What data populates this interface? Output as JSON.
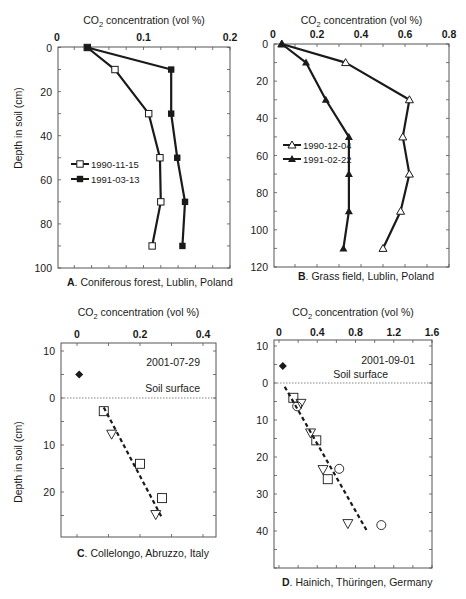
{
  "chart_data": [
    {
      "panel": "A",
      "type": "line",
      "caption_letter": "A",
      "caption": ". Coniferous forest, Lublin, Poland",
      "xlabel": "CO2 concentration (vol %)",
      "ylabel": "Depth in soil (cm)",
      "xlim": [
        0,
        0.2
      ],
      "ylim": [
        0,
        100
      ],
      "xticks": [
        "0",
        "0.1",
        "0.2"
      ],
      "xtick_values": [
        0,
        0.1,
        0.2
      ],
      "xminor_step": 0.02,
      "yticks": [
        "0",
        "20",
        "40",
        "60",
        "80",
        "100"
      ],
      "ytick_values": [
        0,
        20,
        40,
        60,
        80,
        100
      ],
      "yminor_step": 10,
      "legend_position": "middle-left",
      "series": [
        {
          "name": "1990-11-15",
          "marker": "square-open",
          "x": [
            0.035,
            0.067,
            0.106,
            0.119,
            0.12,
            0.11
          ],
          "y": [
            0,
            10,
            30,
            50,
            70,
            90
          ]
        },
        {
          "name": "1991-03-13",
          "marker": "square-filled",
          "x": [
            0.035,
            0.132,
            0.132,
            0.139,
            0.148,
            0.145
          ],
          "y": [
            0,
            10,
            30,
            50,
            70,
            90
          ]
        }
      ]
    },
    {
      "panel": "B",
      "type": "line",
      "caption_letter": "B",
      "caption": ". Grass field, Lublin, Poland",
      "xlabel": "CO2 concentration (vol %)",
      "ylabel": "",
      "xlim": [
        0,
        0.8
      ],
      "ylim": [
        0,
        120
      ],
      "xticks": [
        "0",
        "0.2",
        "0.4",
        "0.6",
        "0.8"
      ],
      "xtick_values": [
        0,
        0.2,
        0.4,
        0.6,
        0.8
      ],
      "xminor_step": 0.1,
      "yticks": [
        "0",
        "20",
        "40",
        "60",
        "80",
        "100",
        "120"
      ],
      "ytick_values": [
        0,
        20,
        40,
        60,
        80,
        100,
        120
      ],
      "yminor_step": 10,
      "legend_position": "middle-left",
      "series": [
        {
          "name": "1990-12-04",
          "marker": "triangle-open",
          "x": [
            0.04,
            0.33,
            0.62,
            0.59,
            0.62,
            0.58,
            0.5
          ],
          "y": [
            0,
            10,
            30,
            50,
            70,
            90,
            110
          ]
        },
        {
          "name": "1991-02-22",
          "marker": "triangle-filled",
          "x": [
            0.04,
            0.15,
            0.24,
            0.345,
            0.345,
            0.345,
            0.32
          ],
          "y": [
            0,
            10,
            30,
            50,
            70,
            90,
            110
          ]
        }
      ]
    },
    {
      "panel": "C",
      "type": "scatter",
      "caption_letter": "C",
      "caption": ". Collelongo, Abruzzo, Italy",
      "xlabel": "CO2 concentration (vol %)",
      "ylabel": "Depth in soil (cm)",
      "xlim": [
        -0.07,
        0.43
      ],
      "ylim": [
        -10,
        30
      ],
      "xticks": [
        "0",
        "0.2",
        "0.4"
      ],
      "xtick_values": [
        0,
        0.2,
        0.4
      ],
      "xminor_step": 0.1,
      "yticks": [
        "10",
        "0",
        "10",
        "20"
      ],
      "ytick_values": [
        -10,
        0,
        10,
        20
      ],
      "yminor_step": 5,
      "date_label": "2001-07-29",
      "surface_label": "Soil surface",
      "surface_depth": 0,
      "series": [
        {
          "name": "atmosphere",
          "marker": "diamond-filled",
          "x": [
            0.007
          ],
          "y": [
            -5
          ]
        },
        {
          "name": "squares",
          "marker": "square-open",
          "x": [
            0.085,
            0.2,
            0.27
          ],
          "y": [
            2.8,
            14,
            21.3
          ]
        },
        {
          "name": "triangles",
          "marker": "triangle-down-open",
          "x": [
            0.11,
            0.25
          ],
          "y": [
            7.7,
            24.8
          ]
        }
      ],
      "trendline": {
        "x": [
          0.085,
          0.27
        ],
        "y": [
          2.0,
          25.5
        ],
        "style": "dashed"
      }
    },
    {
      "panel": "D",
      "type": "scatter",
      "caption_letter": "D",
      "caption": ". Hainich, Thüringen, Germany",
      "xlabel": "CO2 concentration (vol %)",
      "ylabel": "",
      "xlim": [
        -0.05,
        1.6
      ],
      "ylim": [
        -12,
        50
      ],
      "xticks": [
        "0",
        "0.4",
        "0.8",
        "1.2",
        "1.6"
      ],
      "xtick_values": [
        0,
        0.4,
        0.8,
        1.2,
        1.6
      ],
      "xminor_step": 0.2,
      "yticks": [
        "10",
        "0",
        "10",
        "20",
        "30",
        "40"
      ],
      "ytick_values": [
        -10,
        0,
        10,
        20,
        30,
        40
      ],
      "yminor_step": 5,
      "date_label": "2001-09-01",
      "surface_label": "Soil surface",
      "surface_depth": 0,
      "series": [
        {
          "name": "atmosphere",
          "marker": "diamond-filled",
          "x": [
            0.04
          ],
          "y": [
            -4.6
          ]
        },
        {
          "name": "squares",
          "marker": "square-open",
          "x": [
            0.15,
            0.39,
            0.51
          ],
          "y": [
            4,
            15.5,
            26
          ]
        },
        {
          "name": "triangles",
          "marker": "triangle-down-open",
          "x": [
            0.23,
            0.33,
            0.46,
            0.72
          ],
          "y": [
            5.5,
            13.5,
            23.4,
            38
          ]
        },
        {
          "name": "circles",
          "marker": "circle-open",
          "x": [
            0.19,
            0.63,
            1.07
          ],
          "y": [
            6.3,
            23.2,
            38.4
          ]
        }
      ],
      "trendline": {
        "x": [
          0.06,
          0.92
        ],
        "y": [
          1,
          40
        ],
        "style": "dashed"
      }
    }
  ],
  "layout": [
    {
      "plot": {
        "left": 58,
        "top": 47,
        "right": 230,
        "bottom": 268
      },
      "x0px": 57,
      "x1px": 230,
      "xv0": 0,
      "xv1": 0.2,
      "y0px": 47.5,
      "y1px": 268,
      "yv0": 0,
      "yv1": 100,
      "xtitle_y": 24,
      "caption_x": 67,
      "caption_y": 286,
      "ytitle_x": 22,
      "ytitle_y": 128,
      "legend": {
        "x": 71,
        "y": 164,
        "dy": 15
      }
    },
    {
      "plot": {
        "left": 274,
        "top": 44,
        "right": 449,
        "bottom": 267
      },
      "x0px": 273,
      "x1px": 449,
      "xv0": 0,
      "xv1": 0.8,
      "y0px": 44,
      "y1px": 267,
      "yv0": 0,
      "yv1": 120,
      "xtitle_y": 24,
      "caption_x": 298,
      "caption_y": 280,
      "legend": {
        "x": 283,
        "y": 145,
        "dy": 14
      }
    },
    {
      "plot": {
        "left": 61,
        "top": 343,
        "right": 216,
        "bottom": 537
      },
      "x0px": 77,
      "x1px": 203,
      "xv0": 0,
      "xv1": 0.4,
      "y0px": 398,
      "y1px": 445,
      "yv0": 0,
      "yv1": 10,
      "xtitle_y": 316,
      "xtick_y": 338,
      "caption_x": 77,
      "caption_y": 557,
      "ytitle_x": 22,
      "ytitle_y": 462,
      "date_x": 200,
      "date_y": 366,
      "surface_x": 200,
      "surface_y": 392
    },
    {
      "plot": {
        "left": 274,
        "top": 340,
        "right": 432,
        "bottom": 568
      },
      "x0px": 279,
      "x1px": 432,
      "xv0": 0,
      "xv1": 1.6,
      "y0px": 383,
      "y1px": 420,
      "yv0": 0,
      "yv1": 10,
      "xtitle_y": 316,
      "xtick_y": 336,
      "caption_x": 282,
      "caption_y": 586,
      "date_x": 415,
      "date_y": 364,
      "surface_x": 388,
      "surface_y": 378
    }
  ]
}
